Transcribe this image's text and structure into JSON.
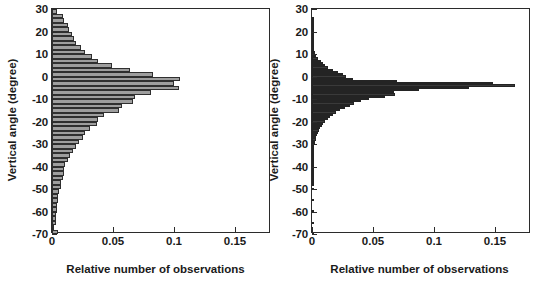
{
  "figure": {
    "axis_label_x": "Relative number of observations",
    "axis_label_y": "Vertical angle (degree)"
  },
  "panels": [
    {
      "title": "urban high-rise"
    },
    {
      "title": "urban low-rise"
    }
  ],
  "chart_data": [
    {
      "type": "bar",
      "orientation": "horizontal",
      "title": "urban high-rise",
      "xlabel": "Relative number of observations",
      "ylabel": "Vertical angle (degree)",
      "xlim": [
        0,
        0.1795
      ],
      "ylim": [
        -70,
        30
      ],
      "xticks": [
        0,
        0.05,
        0.1,
        0.15
      ],
      "xticklabels": [
        "0",
        "0.05",
        "0.1",
        "0.15"
      ],
      "yticks": [
        30,
        20,
        10,
        0,
        -10,
        -20,
        -30,
        -40,
        -50,
        -60,
        -70
      ],
      "yticklabels": [
        "30",
        "20",
        "10",
        "0",
        "-10",
        "-20",
        "-30",
        "-40",
        "-50",
        "-60",
        "-70"
      ],
      "grid": false,
      "legend": "none",
      "bin_width_deg": 2,
      "bar_fill": "#9e9e9e",
      "bar_edge": "#2f2f2f",
      "categories": [
        29,
        27,
        25,
        23,
        21,
        19,
        17,
        15,
        13,
        11,
        9,
        7,
        5,
        3,
        1,
        -1,
        -3,
        -5,
        -7,
        -9,
        -11,
        -13,
        -15,
        -17,
        -19,
        -21,
        -23,
        -25,
        -27,
        -29,
        -31,
        -33,
        -35,
        -37,
        -39,
        -41,
        -43,
        -45,
        -47,
        -49,
        -51,
        -53,
        -55,
        -57,
        -59,
        -61,
        -63,
        -65,
        -67,
        -69
      ],
      "values": [
        0.004,
        0.009,
        0.01,
        0.013,
        0.014,
        0.016,
        0.018,
        0.02,
        0.024,
        0.027,
        0.033,
        0.038,
        0.049,
        0.064,
        0.083,
        0.105,
        0.1,
        0.104,
        0.081,
        0.068,
        0.066,
        0.057,
        0.055,
        0.043,
        0.038,
        0.037,
        0.031,
        0.027,
        0.025,
        0.022,
        0.02,
        0.017,
        0.015,
        0.013,
        0.011,
        0.01,
        0.01,
        0.009,
        0.007,
        0.007,
        0.006,
        0.005,
        0.005,
        0.004,
        0.004,
        0.003,
        0.003,
        0.003,
        0.002,
        0.005
      ]
    },
    {
      "type": "bar",
      "orientation": "horizontal",
      "title": "urban low-rise",
      "xlabel": "Relative number of observations",
      "ylabel": "Vertical angle (degree)",
      "xlim": [
        0,
        0.1795
      ],
      "ylim": [
        -70,
        30
      ],
      "xticks": [
        0,
        0.05,
        0.1,
        0.15
      ],
      "xticklabels": [
        "0",
        "0.05",
        "0.1",
        "0.15"
      ],
      "yticks": [
        30,
        20,
        10,
        0,
        -10,
        -20,
        -30,
        -40,
        -50,
        -60,
        -70
      ],
      "yticklabels": [
        "30",
        "20",
        "10",
        "0",
        "-10",
        "-20",
        "-30",
        "-40",
        "-50",
        "-60",
        "-70"
      ],
      "grid": false,
      "legend": "none",
      "bin_width_deg": 1,
      "bar_fill": "#3a3a3a",
      "bar_edge": "#242424",
      "categories": [
        26,
        25,
        24,
        23,
        22,
        21,
        20,
        19,
        18,
        17,
        16,
        15,
        14,
        13,
        12,
        11,
        10,
        9,
        8,
        7,
        6,
        5,
        4,
        3,
        2,
        1,
        0,
        -1,
        -2,
        -3,
        -4,
        -5,
        -6,
        -7,
        -8,
        -9,
        -10,
        -11,
        -12,
        -13,
        -14,
        -15,
        -16,
        -17,
        -18,
        -19,
        -20,
        -21,
        -22,
        -23,
        -24,
        -25,
        -26,
        -27,
        -28,
        -29,
        -30,
        -31,
        -32,
        -33,
        -34,
        -35,
        -36,
        -37,
        -38,
        -39,
        -40,
        -41,
        -42,
        -43,
        -44,
        -45,
        -46,
        -47,
        -48,
        -50,
        -55,
        -60,
        -65,
        -70
      ],
      "values": [
        0.0008,
        0.0006,
        0.0006,
        0.0006,
        0.0006,
        0.0007,
        0.0007,
        0.0008,
        0.0009,
        0.001,
        0.0011,
        0.0012,
        0.0014,
        0.0016,
        0.0019,
        0.0022,
        0.0028,
        0.0036,
        0.005,
        0.007,
        0.009,
        0.011,
        0.0135,
        0.0175,
        0.0215,
        0.0255,
        0.028,
        0.034,
        0.07,
        0.148,
        0.166,
        0.129,
        0.088,
        0.067,
        0.068,
        0.06,
        0.047,
        0.04,
        0.0345,
        0.031,
        0.027,
        0.023,
        0.0195,
        0.017,
        0.015,
        0.013,
        0.011,
        0.0092,
        0.0078,
        0.0066,
        0.0056,
        0.0046,
        0.004,
        0.0034,
        0.0029,
        0.0025,
        0.0022,
        0.0019,
        0.0017,
        0.0015,
        0.0013,
        0.0012,
        0.0011,
        0.001,
        0.0009,
        0.0008,
        0.0008,
        0.0007,
        0.0007,
        0.0006,
        0.0006,
        0.0005,
        0.0005,
        0.0005,
        0.0004,
        0.0004,
        0.0004,
        0.0003,
        0.0003,
        0.0003
      ]
    }
  ]
}
